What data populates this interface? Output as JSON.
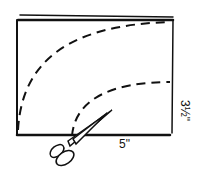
{
  "diagram": {
    "width_label": "5\"",
    "height_label": "3½\"",
    "elements": [
      "rectangle-paper",
      "outer-dashed-curve",
      "inner-dashed-curve",
      "scissors"
    ],
    "stroke_color": "#111111"
  }
}
